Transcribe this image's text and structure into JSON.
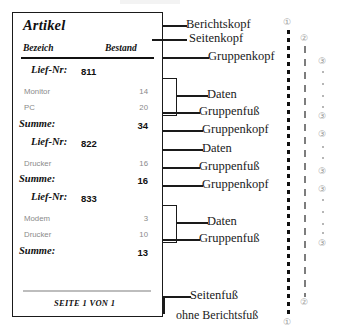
{
  "report": {
    "title": "Artikel",
    "columns": {
      "name": "Bezeich",
      "value": "Bestand"
    },
    "groups": [
      {
        "header_label": "Lief-Nr:",
        "header_value": "811",
        "rows": [
          {
            "name": "Monitor",
            "value": "14"
          },
          {
            "name": "PC",
            "value": "20"
          }
        ],
        "footer_label": "Summe:",
        "footer_value": "34"
      },
      {
        "header_label": "Lief-Nr:",
        "header_value": "822",
        "rows": [
          {
            "name": "Drucker",
            "value": "16"
          }
        ],
        "footer_label": "Summe:",
        "footer_value": "16"
      },
      {
        "header_label": "Lief-Nr:",
        "header_value": "833",
        "rows": [
          {
            "name": "Modem",
            "value": "3"
          },
          {
            "name": "Drucker",
            "value": "10"
          }
        ],
        "footer_label": "Summe:",
        "footer_value": "13"
      }
    ],
    "page_footer": "SEITE 1 VON 1"
  },
  "annotations": {
    "berichtskopf": "Berichtskopf",
    "seitenkopf": "Seitenkopf",
    "gruppenkopf_1": "Gruppenkopf",
    "daten_1": "Daten",
    "gruppenfuss_1": "Gruppenfuß",
    "gruppenkopf_2": "Gruppenkopf",
    "daten_2": "Daten",
    "gruppenfuss_2": "Gruppenfuß",
    "gruppenkopf_3": "Gruppenkopf",
    "daten_3": "Daten",
    "gruppenfuss_3": "Gruppenfuß",
    "seitenfuss": "Seitenfuß",
    "ohne_berichtsfuss": "ohne Berichtsfuß"
  },
  "markers": {
    "level1_top": "①",
    "level2_top": "②",
    "level3_a": "③",
    "level3_b": "③",
    "level3_c": "③",
    "level3_d": "③",
    "level3_e": "③",
    "level3_f": "③",
    "level2_bottom": "②",
    "level1_bottom": "①"
  },
  "colors": {
    "ink": "#1a1a1a",
    "data_gray": "#8a8a8a",
    "marker_gray": "#9a9a9a",
    "footer_rule": "#bdbdbd"
  }
}
